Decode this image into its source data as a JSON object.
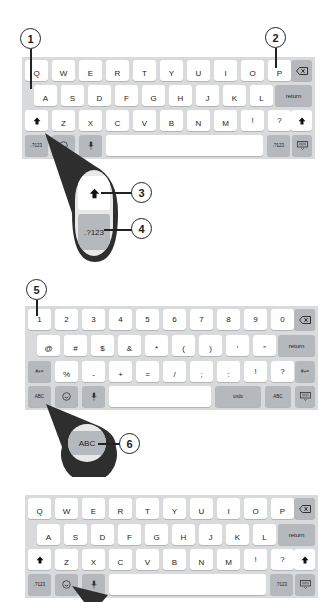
{
  "callouts": {
    "c1": "1",
    "c2": "2",
    "c3": "3",
    "c4": "4",
    "c5": "5",
    "c6": "6"
  },
  "keyboard_letters": {
    "row1": [
      "Q",
      "W",
      "E",
      "R",
      "T",
      "Y",
      "U",
      "I",
      "O",
      "P"
    ],
    "row2": [
      "A",
      "S",
      "D",
      "F",
      "G",
      "H",
      "J",
      "K",
      "L"
    ],
    "row3": [
      "Z",
      "X",
      "C",
      "V",
      "B",
      "N",
      "M",
      "!",
      "?"
    ],
    "row3_hints": [
      "",
      "",
      "",
      "",
      "",
      "",
      "",
      ",",
      "."
    ],
    "return_label": "return",
    "numbers_label": ".?123",
    "backspace_icon": "backspace-icon",
    "shift_icon": "shift-icon",
    "mic_icon": "microphone-icon",
    "globe_icon": "emoji-icon",
    "hide_keyboard_icon": "keyboard-hide-icon"
  },
  "magnifier_1": {
    "shift_icon": "shift-icon",
    "numbers_label": ".?123"
  },
  "keyboard_numbers": {
    "row1": [
      "1",
      "2",
      "3",
      "4",
      "5",
      "6",
      "7",
      "8",
      "9",
      "0"
    ],
    "row2": [
      "@",
      "#",
      "$",
      "&",
      "*",
      "(",
      ")",
      "’",
      "”"
    ],
    "row3": [
      "%",
      "-",
      "+",
      "=",
      "/",
      ";",
      ":",
      "!",
      "?"
    ],
    "row3_hints": [
      "",
      "",
      "",
      "",
      "",
      "",
      "",
      ",",
      "."
    ],
    "symbols_label": "#+=",
    "return_label": "return",
    "abc_label": "ABC",
    "undo_label": "undo"
  },
  "magnifier_2": {
    "abc_label": "ABC"
  },
  "keyboard_letters_2": {
    "row1": [
      "Q",
      "W",
      "E",
      "R",
      "T",
      "Y",
      "U",
      "I",
      "O",
      "P"
    ],
    "row2": [
      "A",
      "S",
      "D",
      "F",
      "G",
      "H",
      "J",
      "K",
      "L"
    ],
    "row3": [
      "Z",
      "X",
      "C",
      "V",
      "B",
      "N",
      "M",
      "!",
      "?"
    ],
    "row3_hints": [
      "",
      "",
      "",
      "",
      "",
      "",
      "",
      ",",
      "."
    ],
    "return_label": "return",
    "numbers_label": ".?123"
  }
}
